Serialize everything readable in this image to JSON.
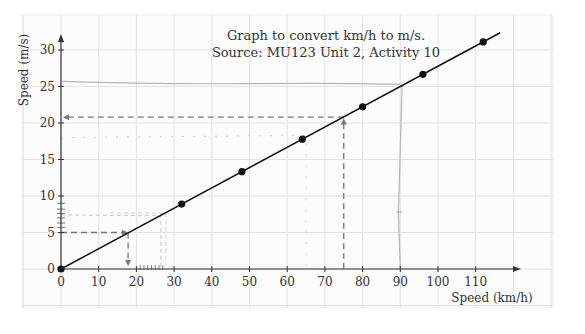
{
  "chart_data": {
    "type": "line",
    "title": "Graph to convert km/h to m/s.",
    "subtitle": "Source: MU123 Unit 2, Activity 10",
    "xlabel": "Speed (km/h)",
    "ylabel": "Speed (m/s)",
    "xlim": [
      0,
      120
    ],
    "ylim": [
      0,
      32
    ],
    "grid": true,
    "legend": "none",
    "x_ticks": [
      0,
      10,
      20,
      30,
      40,
      50,
      60,
      70,
      80,
      90,
      100,
      110
    ],
    "y_ticks": [
      0,
      5,
      10,
      15,
      20,
      25,
      30
    ],
    "series": [
      {
        "name": "km/h to m/s conversion line",
        "x": [
          0,
          32,
          48,
          64,
          80,
          96,
          112
        ],
        "y": [
          0,
          8.89,
          13.33,
          17.78,
          22.22,
          26.67,
          31.11
        ],
        "marker": "filled-circle",
        "color": "#111111"
      }
    ],
    "annotations": [
      {
        "type": "dashed-arrow",
        "description": "read 5 m/s across to line, then down to x axis",
        "from": [
          0,
          5
        ],
        "via": [
          18,
          5
        ],
        "to": [
          18,
          0
        ]
      },
      {
        "type": "dashed-arrow",
        "description": "read 75 km/h up to line, then across to y axis",
        "from": [
          75,
          0
        ],
        "via": [
          75,
          20.8
        ],
        "to": [
          0,
          20.8
        ]
      },
      {
        "type": "pencil-dashed",
        "description": "faint dashed line from about 18 m/s to 65 km/h",
        "from": [
          0,
          18
        ],
        "via": [
          65,
          18
        ],
        "to": [
          65,
          0
        ]
      },
      {
        "type": "pencil-dashed",
        "description": "faint dashed lines near 7.5 m/s to 26-28 km/h",
        "from": [
          0,
          7.5
        ],
        "via": [
          27,
          7.5
        ],
        "to": [
          27,
          0
        ]
      },
      {
        "type": "pencil-line",
        "description": "hand-drawn horizontal line near 25.5 m/s",
        "y": 25.5
      },
      {
        "type": "pencil-line",
        "description": "hand-drawn vertical line near 90 km/h",
        "x": 90
      }
    ]
  },
  "labels": {
    "title": "Graph to convert km/h to m/s.",
    "subtitle": "Source: MU123 Unit 2, Activity 10",
    "xlabel": "Speed (km/h)",
    "ylabel": "Speed (m/s)",
    "x_tick_labels": [
      "0",
      "10",
      "20",
      "30",
      "40",
      "50",
      "60",
      "70",
      "80",
      "90",
      "100",
      "110"
    ],
    "y_tick_labels": [
      "0",
      "5",
      "10",
      "15",
      "20",
      "25",
      "30"
    ]
  },
  "colors": {
    "line": "#111111",
    "grid": "#e2e2e2",
    "dashed_arrow": "#777777",
    "pencil": "#b5b5b5"
  }
}
